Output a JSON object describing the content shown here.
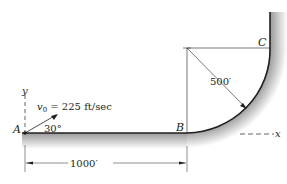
{
  "diagram": {
    "points": {
      "A": "A",
      "B": "B",
      "C": "C"
    },
    "axes": {
      "x": "x",
      "y": "y"
    },
    "velocity": {
      "symbol": "v",
      "subscript": "0",
      "text": " = 225 ft/sec"
    },
    "angle": "30°",
    "radius_label": "500′",
    "distance_label": "1000′",
    "colors": {
      "line": "#231f20",
      "shade": "#bdbdbd"
    }
  }
}
